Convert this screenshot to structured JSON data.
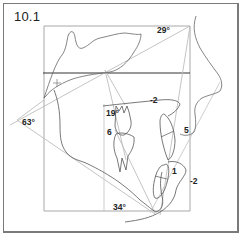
{
  "figure": {
    "label": "10.1"
  },
  "annotations": {
    "angle_top": "29°",
    "angle_left": "63°",
    "angle_inner": "19°",
    "angle_bottom": "34°",
    "value_upper_incisor_line": "-2",
    "value_molar": "6",
    "value_lip": "5",
    "value_lower_incisor": "1",
    "value_chin": "-2"
  },
  "colors": {
    "trace": "#555555",
    "construction": "#b8b8b8",
    "box": "#a8a8a8",
    "horizontal": "#333333"
  }
}
